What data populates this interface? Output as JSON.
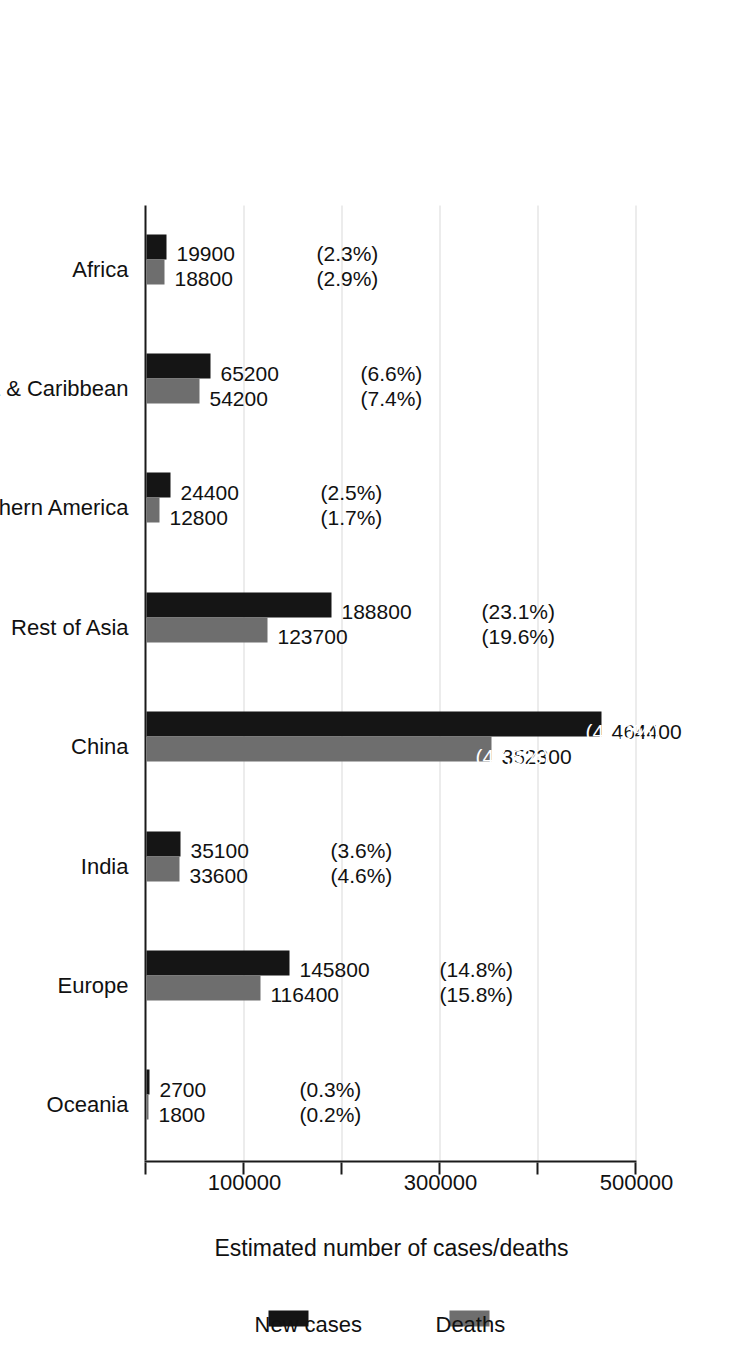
{
  "chart_data": {
    "type": "bar",
    "title": "",
    "subtitle": "",
    "xlabel": "",
    "ylabel": "Estimated number of cases/deaths",
    "orientation": "vertical-bars-on-rotated-page",
    "grid": true,
    "legend_position": "right",
    "ylim": [
      0,
      500000
    ],
    "yticks": [
      0,
      100000,
      200000,
      300000,
      400000,
      500000
    ],
    "ytick_labels": [
      "",
      "100000",
      "",
      "300000",
      "",
      "500000"
    ],
    "categories": [
      "Africa",
      "Latin America & Caribbean",
      "Northern America",
      "Rest of Asia",
      "China",
      "India",
      "Europe",
      "Oceania"
    ],
    "series": [
      {
        "name": "New cases",
        "color": "#151515",
        "values": [
          19900,
          65200,
          24400,
          188800,
          464400,
          35100,
          145800,
          2700
        ],
        "value_labels": [
          "19900",
          "65200",
          "24400",
          "188800",
          "464400",
          "35100",
          "145800",
          "2700"
        ],
        "percent_labels": [
          "(2.3%)",
          "(6.6%)",
          "(2.5%)",
          "(23.1%)",
          "(47.0%)",
          "(3.6%)",
          "(14.8%)",
          "(0.3%)"
        ]
      },
      {
        "name": "Deaths",
        "color": "#6e6e6e",
        "values": [
          18800,
          54200,
          12800,
          123700,
          352300,
          33600,
          116400,
          1800
        ],
        "value_labels": [
          "18800",
          "54200",
          "12800",
          "123700",
          "352300",
          "33600",
          "116400",
          "1800"
        ],
        "percent_labels": [
          "(2.9%)",
          "(7.4%)",
          "(1.7%)",
          "(19.6%)",
          "(47.8%)",
          "(4.6%)",
          "(15.8%)",
          "(0.2%)"
        ]
      }
    ]
  },
  "legend": {
    "items": [
      {
        "label": "New cases",
        "color": "#151515"
      },
      {
        "label": "Deaths",
        "color": "#6e6e6e"
      }
    ]
  },
  "axis": {
    "title": "Estimated number of cases/deaths"
  }
}
